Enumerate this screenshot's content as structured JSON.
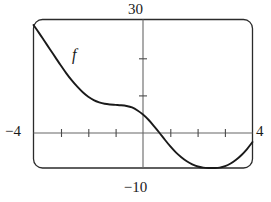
{
  "figure": {
    "kind": "graphing-calculator-viewport",
    "curve_label": "f",
    "labels": {
      "y_max": "30",
      "y_min": "−10",
      "x_min": "−4",
      "x_max": "4"
    },
    "colors": {
      "curve": "#1a1a1a",
      "frame": "#2b2b2b",
      "axis": "#555555",
      "background": "#ffffff"
    }
  },
  "chart_data": {
    "type": "line",
    "title": "",
    "subtitle": "",
    "xlabel": "",
    "ylabel": "",
    "xlim": [
      -4,
      4
    ],
    "ylim": [
      -10,
      30
    ],
    "grid": false,
    "legend": false,
    "axis_tick_labels": {
      "x": [
        "−4",
        "4"
      ],
      "y": [
        "−10",
        "30"
      ]
    },
    "x_ticks": [
      -3,
      -2,
      -1,
      1,
      2,
      3
    ],
    "y_ticks": [
      10,
      20
    ],
    "annotations": [
      {
        "text": "f",
        "x": -1.45,
        "y": 19.5,
        "style": "italic"
      }
    ],
    "series": [
      {
        "name": "f",
        "x": [
          -4.0,
          -3.8,
          -3.6,
          -3.4,
          -3.2,
          -3.0,
          -2.8,
          -2.6,
          -2.4,
          -2.2,
          -2.0,
          -1.8,
          -1.6,
          -1.4,
          -1.2,
          -1.0,
          -0.8,
          -0.6,
          -0.4,
          -0.2,
          0.0,
          0.2,
          0.4,
          0.6,
          0.8,
          1.0,
          1.2,
          1.4,
          1.6,
          1.8,
          2.0,
          2.2,
          2.4,
          2.6,
          2.8,
          3.0,
          3.2,
          3.4,
          3.6,
          3.8,
          4.0
        ],
        "y": [
          28.5,
          26.4,
          24.2,
          22.0,
          19.8,
          17.6,
          15.5,
          13.6,
          11.9,
          10.4,
          9.2,
          8.3,
          7.7,
          7.3,
          7.1,
          7.0,
          6.9,
          6.7,
          6.3,
          5.5,
          4.4,
          3.0,
          1.3,
          -0.5,
          -2.4,
          -4.2,
          -5.8,
          -7.1,
          -8.2,
          -9.0,
          -9.6,
          -9.9,
          -10.0,
          -10.0,
          -9.9,
          -9.5,
          -8.8,
          -7.8,
          -6.5,
          -4.9,
          -3.0
        ]
      }
    ]
  }
}
